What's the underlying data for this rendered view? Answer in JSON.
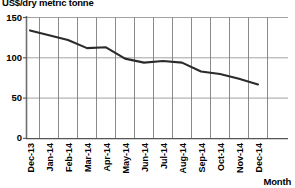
{
  "chart_data": {
    "type": "line",
    "title": "",
    "ylabel": "US$/dry metric tonne",
    "xlabel": "Month",
    "ylim": [
      0,
      150
    ],
    "yticks": [
      0,
      50,
      100,
      150
    ],
    "grid": true,
    "legend": false,
    "categories": [
      "Dec-13",
      "Jan-14",
      "Feb-14",
      "Mar-14",
      "Apr-14",
      "May-14",
      "Jun-14",
      "Jul-14",
      "Aug-14",
      "Sep-14",
      "Oct-14",
      "Nov-14",
      "Dec-14"
    ],
    "values": [
      134,
      128,
      122,
      112,
      113,
      99,
      94,
      96,
      94,
      83,
      80,
      74,
      67
    ],
    "series": [
      {
        "name": "Iron ore price",
        "values": [
          134,
          128,
          122,
          112,
          113,
          99,
          94,
          96,
          94,
          83,
          80,
          74,
          67
        ]
      }
    ]
  },
  "axes": {
    "y_title": "US$/dry metric tonne",
    "x_title": "Month",
    "y_tick_labels": [
      "150",
      "100",
      "50",
      "0"
    ],
    "x_tick_labels": [
      "Dec-13",
      "Jan-14",
      "Feb-14",
      "Mar-14",
      "Apr-14",
      "May-14",
      "Jun-14",
      "Jul-14",
      "Aug-14",
      "Sep-14",
      "Oct-14",
      "Nov-14",
      "Dec-14"
    ]
  },
  "style": {
    "line_color": "#2b2b2b",
    "grid_color": "#7d7d7d",
    "axis_color": "#6f6f6f",
    "text_color": "#000000",
    "background": "#ffffff"
  }
}
